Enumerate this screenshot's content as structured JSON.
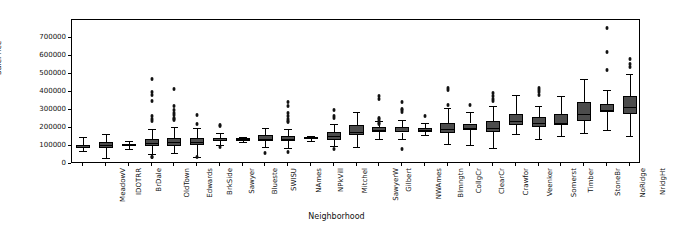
{
  "chart_data": {
    "type": "box",
    "title": "",
    "xlabel": "Neighborhood",
    "ylabel": "SalePrice",
    "ylim": [
      0,
      800000
    ],
    "yticks": [
      0,
      100000,
      200000,
      300000,
      400000,
      500000,
      600000,
      700000
    ],
    "ytick_labels": [
      "0",
      "100000",
      "200000",
      "300000",
      "400000",
      "500000",
      "600000",
      "700000"
    ],
    "grid": false,
    "legend": null,
    "box_facecolor": "#4c4c4c",
    "box_edgecolor": "#000000",
    "categories": [
      "MeadowV",
      "IDOTRR",
      "BrDale",
      "OldTown",
      "Edwards",
      "BrkSide",
      "Sawyer",
      "Blueste",
      "SWISU",
      "NAmes",
      "NPkVill",
      "Mitchel",
      "SawyerW",
      "Gilbert",
      "NWAmes",
      "Blmngtn",
      "CollgCr",
      "ClearCr",
      "Crawfor",
      "Veenker",
      "Somerst",
      "Timber",
      "StoneBr",
      "NoRidge",
      "NridgHt"
    ],
    "boxes": [
      {
        "name": "MeadowV",
        "whislo": 73000,
        "q1": 88000,
        "med": 96000,
        "q3": 108000,
        "whishi": 152000,
        "fliers": []
      },
      {
        "name": "IDOTRR",
        "whislo": 34900,
        "q1": 88000,
        "med": 103000,
        "q3": 120000,
        "whishi": 168000,
        "fliers": []
      },
      {
        "name": "BrDale",
        "whislo": 83000,
        "q1": 100000,
        "med": 106000,
        "q3": 111000,
        "whishi": 125500,
        "fliers": []
      },
      {
        "name": "OldTown",
        "whislo": 53000,
        "q1": 99000,
        "med": 119000,
        "q3": 139000,
        "whishi": 196000,
        "fliers": [
          475000,
          400000,
          385000,
          350000,
          265000,
          248000,
          240000,
          36500,
          40000
        ]
      },
      {
        "name": "Edwards",
        "whislo": 58500,
        "q1": 100000,
        "med": 121750,
        "q3": 145000,
        "whishi": 205000,
        "fliers": [
          415000,
          320000,
          302000,
          284000,
          270000,
          256000,
          250000,
          244000
        ]
      },
      {
        "name": "BrkSide",
        "whislo": 39300,
        "q1": 106500,
        "med": 124300,
        "q3": 144000,
        "whishi": 200000,
        "fliers": [
          275000,
          223500,
          38000
        ]
      },
      {
        "name": "Sawyer",
        "whislo": 108000,
        "q1": 126000,
        "med": 135000,
        "q3": 145500,
        "whishi": 172000,
        "fliers": [
          215000,
          212000,
          92000
        ]
      },
      {
        "name": "Blueste",
        "whislo": 124000,
        "q1": 127500,
        "med": 137500,
        "q3": 144000,
        "whishi": 151000,
        "fliers": []
      },
      {
        "name": "SWISU",
        "whislo": 95000,
        "q1": 130000,
        "med": 139500,
        "q3": 161000,
        "whishi": 197900,
        "fliers": [
          60000
        ]
      },
      {
        "name": "NAmes",
        "whislo": 88000,
        "q1": 130000,
        "med": 140000,
        "q3": 155000,
        "whishi": 192000,
        "fliers": [
          345000,
          320000,
          284000,
          264000,
          250000,
          241000,
          235000,
          68500
        ]
      },
      {
        "name": "NPkVill",
        "whislo": 130000,
        "q1": 140000,
        "med": 146000,
        "q3": 152000,
        "whishi": 155000,
        "fliers": []
      },
      {
        "name": "Mitchel",
        "whislo": 100000,
        "q1": 135000,
        "med": 153500,
        "q3": 180000,
        "whishi": 220000,
        "fliers": [
          300000,
          265000,
          258000,
          82500
        ]
      },
      {
        "name": "SawyerW",
        "whislo": 95000,
        "q1": 160000,
        "med": 179900,
        "q3": 215000,
        "whishi": 290000,
        "fliers": []
      },
      {
        "name": "Gilbert",
        "whislo": 137500,
        "q1": 180000,
        "med": 190000,
        "q3": 204000,
        "whishi": 240000,
        "fliers": [
          378000,
          360000,
          258000,
          247500,
          238000,
          228000,
          222000
        ]
      },
      {
        "name": "NWAmes",
        "whislo": 137500,
        "q1": 175000,
        "med": 182900,
        "q3": 205000,
        "whishi": 243000,
        "fliers": [
          345000,
          306000,
          299000,
          289000,
          82000
        ]
      },
      {
        "name": "Blmngtn",
        "whislo": 159500,
        "q1": 178500,
        "med": 191000,
        "q3": 200000,
        "whishi": 230000,
        "fliers": [
          264561
        ]
      },
      {
        "name": "CollgCr",
        "whislo": 110000,
        "q1": 173500,
        "med": 197200,
        "q3": 230000,
        "whishi": 310000,
        "fliers": [
          424870,
          410000,
          328000
        ]
      },
      {
        "name": "ClearCr",
        "whislo": 107500,
        "q1": 190000,
        "med": 200250,
        "q3": 225000,
        "whishi": 290000,
        "fliers": [
          328000
        ]
      },
      {
        "name": "Crawfor",
        "whislo": 90000,
        "q1": 180000,
        "med": 200624,
        "q3": 240000,
        "whishi": 320000,
        "fliers": [
          392500,
          377500,
          361919,
          351000
        ]
      },
      {
        "name": "Veenker",
        "whislo": 168000,
        "q1": 215000,
        "med": 239500,
        "q3": 280000,
        "whishi": 385000,
        "fliers": []
      },
      {
        "name": "Somerst",
        "whislo": 139000,
        "q1": 205000,
        "med": 225500,
        "q3": 262000,
        "whishi": 325000,
        "fliers": [
          423000,
          410000,
          397900,
          385000
        ]
      },
      {
        "name": "Timber",
        "whislo": 154000,
        "q1": 218000,
        "med": 228475,
        "q3": 280000,
        "whishi": 379900,
        "fliers": []
      },
      {
        "name": "StoneBr",
        "whislo": 170000,
        "q1": 240000,
        "med": 278000,
        "q3": 345000,
        "whishi": 475000,
        "fliers": []
      },
      {
        "name": "NoRidge",
        "whislo": 190000,
        "q1": 290000,
        "med": 301500,
        "q3": 335000,
        "whishi": 410000,
        "fliers": [
          755000,
          625000,
          520000
        ]
      },
      {
        "name": "NridgHt",
        "whislo": 154000,
        "q1": 280000,
        "med": 315000,
        "q3": 377500,
        "whishi": 500000,
        "fliers": [
          582933,
          556581,
          538000
        ]
      }
    ]
  },
  "axis": {
    "ylabel": "SalePrice",
    "xlabel": "Neighborhood"
  }
}
